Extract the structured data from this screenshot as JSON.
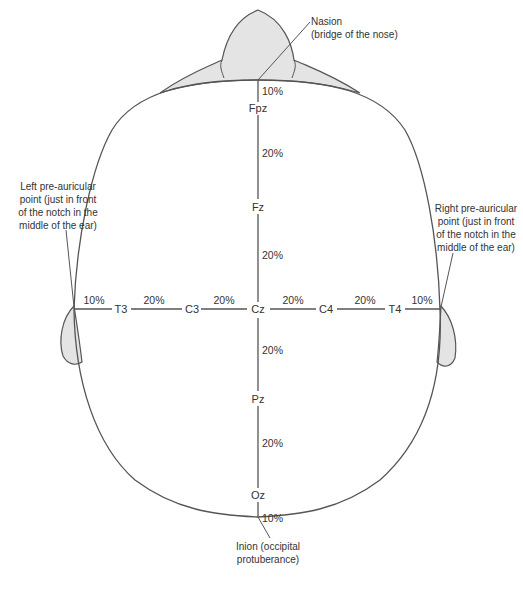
{
  "diagram": {
    "colors": {
      "line": "#555555",
      "fill": "#e4e4e4",
      "text": "#333333"
    },
    "landmarks": {
      "nasion": {
        "line1": "Nasion",
        "line2": "(bridge of the nose)"
      },
      "inion": {
        "line1": "Inion (occipital",
        "line2": "protuberance)"
      },
      "left_preauricular": {
        "line1": "Left pre-auricular",
        "line2": "point (just in front",
        "line3": "of the notch in the",
        "line4": "middle of the ear)"
      },
      "right_preauricular": {
        "line1": "Right pre-auricular",
        "line2": "point (just in front",
        "line3": "of the notch in the",
        "line4": "middle of the ear)"
      }
    },
    "midline": {
      "electrodes": [
        "Fpz",
        "Fz",
        "Cz",
        "Pz",
        "Oz"
      ],
      "segments": [
        "10%",
        "20%",
        "20%",
        "20%",
        "20%",
        "10%"
      ]
    },
    "coronal": {
      "electrodes": [
        "T3",
        "C3",
        "Cz",
        "C4",
        "T4"
      ],
      "segments": [
        "10%",
        "20%",
        "20%",
        "20%",
        "20%",
        "10%"
      ]
    }
  }
}
